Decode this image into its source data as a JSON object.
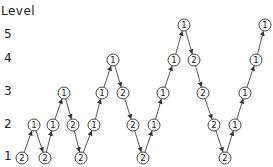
{
  "axis": {
    "title": "Level",
    "levels": [
      {
        "label": "5",
        "y": 35
      },
      {
        "label": "4",
        "y": 59
      },
      {
        "label": "3",
        "y": 92
      },
      {
        "label": "2",
        "y": 125
      },
      {
        "label": "1",
        "y": 157
      }
    ]
  },
  "level_y": {
    "1": 158,
    "2": 125,
    "3": 93,
    "4": 60,
    "5": 25
  },
  "nodes": [
    {
      "x": 22,
      "level": 1,
      "label": "2"
    },
    {
      "x": 34,
      "level": 2,
      "label": "1"
    },
    {
      "x": 45,
      "level": 1,
      "label": "2"
    },
    {
      "x": 53,
      "level": 2,
      "label": "1"
    },
    {
      "x": 64,
      "level": 3,
      "label": "1"
    },
    {
      "x": 73,
      "level": 2,
      "label": "2"
    },
    {
      "x": 81,
      "level": 1,
      "label": "2"
    },
    {
      "x": 94,
      "level": 2,
      "label": "1"
    },
    {
      "x": 102,
      "level": 3,
      "label": "1"
    },
    {
      "x": 113,
      "level": 4,
      "label": "1"
    },
    {
      "x": 123,
      "level": 3,
      "label": "2"
    },
    {
      "x": 133,
      "level": 2,
      "label": "2"
    },
    {
      "x": 143,
      "level": 1,
      "label": "2"
    },
    {
      "x": 154,
      "level": 2,
      "label": "1"
    },
    {
      "x": 163,
      "level": 3,
      "label": "1"
    },
    {
      "x": 174,
      "level": 4,
      "label": "1"
    },
    {
      "x": 184,
      "level": 5,
      "label": "1"
    },
    {
      "x": 194,
      "level": 4,
      "label": "2"
    },
    {
      "x": 203,
      "level": 3,
      "label": "2"
    },
    {
      "x": 214,
      "level": 2,
      "label": "2"
    },
    {
      "x": 225,
      "level": 1,
      "label": "2"
    },
    {
      "x": 235,
      "level": 2,
      "label": "1"
    },
    {
      "x": 245,
      "level": 3,
      "label": "1"
    },
    {
      "x": 256,
      "level": 4,
      "label": "1"
    },
    {
      "x": 265,
      "level": 5,
      "label": "1"
    }
  ],
  "style": {
    "line_color": "#333333",
    "node_stroke": "#333333",
    "node_fill": "#ffffff",
    "node_radius": 6
  }
}
